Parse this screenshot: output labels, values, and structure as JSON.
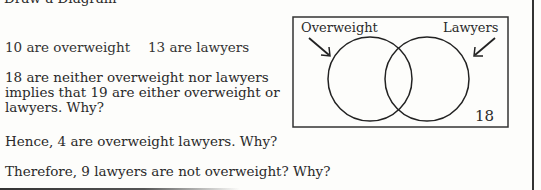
{
  "header": {
    "title": "Draw a Diagram"
  },
  "facts": {
    "overweight": "10 are overweight",
    "lawyers": "13 are lawyers"
  },
  "reasoning": {
    "neither": "18 are neither overweight nor lawyers implies that 19 are either overweight or lawyers.  Why?",
    "hence": "Hence, 4 are overweight lawyers.  Why?",
    "therefore": "Therefore, 9 lawyers are not overweight?  Why?"
  },
  "venn": {
    "left_label": "Overweight",
    "right_label": "Lawyers",
    "outside_value": "18"
  }
}
